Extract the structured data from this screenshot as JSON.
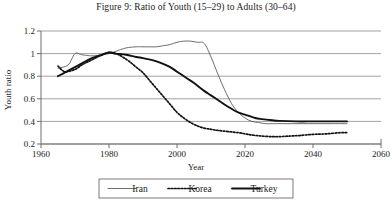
{
  "figure": {
    "title": "Figure 9: Ratio of Youth (15–29) to Adults (30–64)"
  },
  "colors": {
    "axis": "#6e6e6e",
    "grid": "#8a8a8a",
    "text": "#1b1b1b",
    "iran": "#5d5d5d",
    "korea": "#111111",
    "turkey": "#111111",
    "legend_border": "#6e6e6e",
    "background": "#ffffff"
  },
  "axes": {
    "x": {
      "label": "Year",
      "min": 1960,
      "max": 2060,
      "ticks": [
        1960,
        1980,
        2000,
        2020,
        2040,
        2060
      ],
      "tick_labels": [
        "1960",
        "1980",
        "2000",
        "2020",
        "2040",
        "2060"
      ]
    },
    "y": {
      "label": "Youth ratio",
      "min": 0.2,
      "max": 1.2,
      "ticks": [
        0.2,
        0.4,
        0.6,
        0.8,
        1,
        1.2
      ],
      "tick_labels": [
        "0.2",
        "0.4",
        "0.6",
        "0.8",
        "1",
        "1.2"
      ]
    }
  },
  "legend": {
    "entries": [
      {
        "label": "Iran",
        "style": "solid-thin",
        "color": "#5d5d5d"
      },
      {
        "label": "Korea",
        "style": "dotted",
        "color": "#111111"
      },
      {
        "label": "Turkey",
        "style": "solid-thick",
        "color": "#111111"
      }
    ]
  },
  "chart_data": {
    "type": "line",
    "title": "Figure 9: Ratio of Youth (15–29) to Adults (30–64)",
    "xlabel": "Year",
    "ylabel": "Youth ratio",
    "xlim": [
      1960,
      2060
    ],
    "ylim": [
      0.2,
      1.2
    ],
    "grid": true,
    "grid_axis": "y",
    "legend_position": "below",
    "series": [
      {
        "name": "Iran",
        "style": "solid-thin",
        "color": "#5d5d5d",
        "x": [
          1965,
          1968,
          1970,
          1972,
          1975,
          1978,
          1980,
          1982,
          1985,
          1988,
          1990,
          1992,
          1994,
          1996,
          1998,
          2000,
          2002,
          2004,
          2006,
          2008,
          2010,
          2012,
          2014,
          2016,
          2018,
          2020,
          2022,
          2024,
          2026,
          2028,
          2030,
          2035,
          2040,
          2045,
          2050
        ],
        "y": [
          0.87,
          0.9,
          1.0,
          0.99,
          0.98,
          0.99,
          1.0,
          1.02,
          1.05,
          1.06,
          1.06,
          1.06,
          1.06,
          1.07,
          1.08,
          1.1,
          1.11,
          1.11,
          1.1,
          1.09,
          0.97,
          0.82,
          0.68,
          0.56,
          0.48,
          0.43,
          0.4,
          0.39,
          0.38,
          0.38,
          0.38,
          0.38,
          0.38,
          0.38,
          0.38
        ]
      },
      {
        "name": "Korea",
        "style": "dotted",
        "color": "#111111",
        "x": [
          1965,
          1967,
          1970,
          1972,
          1974,
          1976,
          1978,
          1980,
          1982,
          1984,
          1986,
          1988,
          1990,
          1992,
          1994,
          1996,
          1998,
          2000,
          2002,
          2004,
          2006,
          2008,
          2010,
          2012,
          2015,
          2018,
          2020,
          2022,
          2025,
          2028,
          2030,
          2033,
          2036,
          2040,
          2044,
          2048,
          2050
        ],
        "y": [
          0.89,
          0.84,
          0.86,
          0.9,
          0.93,
          0.96,
          0.99,
          1.01,
          1.0,
          0.97,
          0.93,
          0.88,
          0.83,
          0.76,
          0.69,
          0.62,
          0.55,
          0.48,
          0.43,
          0.39,
          0.36,
          0.34,
          0.33,
          0.32,
          0.31,
          0.3,
          0.29,
          0.28,
          0.27,
          0.265,
          0.265,
          0.27,
          0.275,
          0.285,
          0.29,
          0.3,
          0.3
        ]
      },
      {
        "name": "Turkey",
        "style": "solid-thick",
        "color": "#111111",
        "x": [
          1965,
          1968,
          1970,
          1973,
          1975,
          1978,
          1980,
          1982,
          1985,
          1988,
          1990,
          1993,
          1995,
          1998,
          2000,
          2003,
          2005,
          2008,
          2010,
          2013,
          2015,
          2018,
          2020,
          2023,
          2025,
          2028,
          2030,
          2035,
          2040,
          2045,
          2050
        ],
        "y": [
          0.8,
          0.85,
          0.88,
          0.93,
          0.96,
          0.99,
          1.01,
          1.0,
          0.99,
          0.97,
          0.96,
          0.94,
          0.92,
          0.88,
          0.84,
          0.78,
          0.74,
          0.67,
          0.63,
          0.57,
          0.53,
          0.48,
          0.46,
          0.43,
          0.42,
          0.41,
          0.405,
          0.4,
          0.4,
          0.4,
          0.4
        ]
      }
    ]
  }
}
